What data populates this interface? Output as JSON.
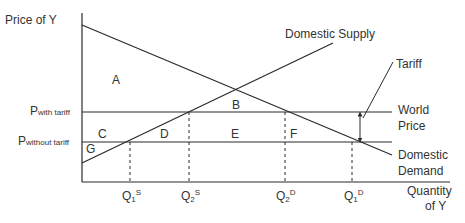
{
  "axes": {
    "y_label": "Price of Y",
    "x_label_line1": "Quantity",
    "x_label_line2": "of Y"
  },
  "price_levels": {
    "with_tariff": {
      "main": "P",
      "sub": "with tariff"
    },
    "without_tariff": {
      "main": "P",
      "sub": "without tariff"
    }
  },
  "quantities": [
    {
      "main": "Q",
      "sub": "1",
      "sup": "S"
    },
    {
      "main": "Q",
      "sub": "2",
      "sup": "S"
    },
    {
      "main": "Q",
      "sub": "2",
      "sup": "D"
    },
    {
      "main": "Q",
      "sub": "1",
      "sup": "D"
    }
  ],
  "curves": {
    "supply": "Domestic Supply",
    "demand_line1": "Domestic",
    "demand_line2": "Demand",
    "world_price_line1": "World",
    "world_price_line2": "Price",
    "tariff": "Tariff"
  },
  "regions": [
    "A",
    "B",
    "C",
    "D",
    "E",
    "F",
    "G"
  ],
  "colors": {
    "line": "#2a2a2a",
    "background": "#ffffff"
  }
}
